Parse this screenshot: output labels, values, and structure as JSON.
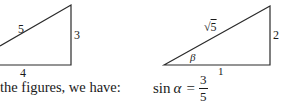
{
  "figure_left": {
    "hypotenuse": "5",
    "vertical_leg": "3",
    "horizontal_leg": "4"
  },
  "figure_right": {
    "hypotenuse_radicand": "5",
    "hypotenuse_symbol": "√",
    "vertical_leg": "2",
    "horizontal_leg": "1",
    "angle": "β"
  },
  "caption": "the figures, we have:",
  "formula": {
    "function": "sin",
    "angle": "α",
    "equals": "=",
    "numerator": "3",
    "denominator": "5"
  },
  "colors": {
    "line": "#2a2a2a",
    "text": "#1a1a1a"
  }
}
